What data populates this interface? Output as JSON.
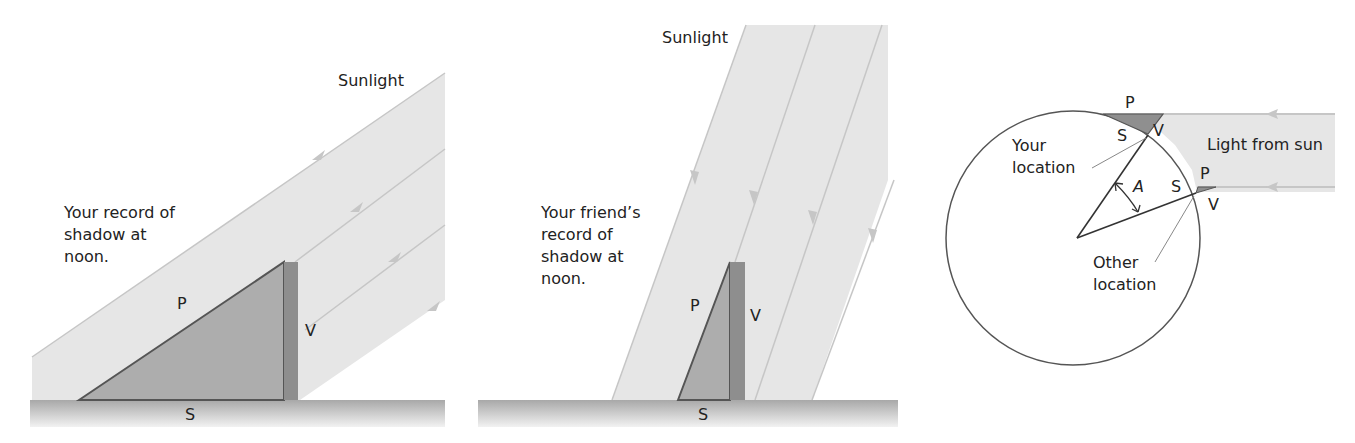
{
  "figure": {
    "panels": [
      {
        "id": "your-record",
        "sunlight_label": "Sunlight",
        "caption": "Your record of\nshadow at\nnoon.",
        "labels": {
          "P": "P",
          "V": "V",
          "S": "S"
        }
      },
      {
        "id": "friend-record",
        "sunlight_label": "Sunlight",
        "caption": "Your friend’s\nrecord of\nshadow at\nnoon.",
        "labels": {
          "P": "P",
          "V": "V",
          "S": "S"
        }
      },
      {
        "id": "earth-geometry",
        "light_label": "Light from sun",
        "your_location": "Your\nlocation",
        "other_location": "Other\nlocation",
        "angle_label": "A",
        "top_labels": {
          "P": "P",
          "V": "V",
          "S": "S"
        },
        "side_labels": {
          "P": "P",
          "V": "V",
          "S": "S"
        }
      }
    ],
    "colors": {
      "sunlight_band": "#e6e6e6",
      "sunlight_ray": "#c4c4c4",
      "shadow_fill": "#acacac",
      "shadow_edge": "#5a5a5a",
      "gnomon": "#8e8e8e",
      "ground": "#b8b8b8",
      "line": "#444444"
    }
  }
}
